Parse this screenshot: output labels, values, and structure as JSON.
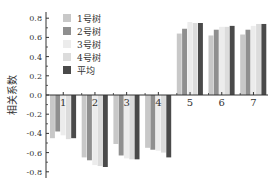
{
  "chart_data": {
    "type": "bar",
    "title": "",
    "xlabel": "",
    "ylabel": "相关系数",
    "categories": [
      "1",
      "2",
      "3",
      "4",
      "5",
      "6",
      "7"
    ],
    "ylim": [
      -0.8,
      0.8
    ],
    "yticks": [
      "0.8",
      "0.6",
      "0.4",
      "0.2",
      "0.0",
      "-0.2",
      "-0.4",
      "-0.6",
      "-0.8"
    ],
    "grid": false,
    "legend_position": "upper-left inside",
    "series": [
      {
        "name": "1号树",
        "color": "#c8c8c8",
        "values": [
          -0.45,
          -0.65,
          -0.51,
          -0.55,
          0.64,
          0.62,
          0.63
        ]
      },
      {
        "name": "2号树",
        "color": "#8f8f8f",
        "values": [
          -0.38,
          -0.68,
          -0.63,
          -0.57,
          0.69,
          0.68,
          0.68
        ]
      },
      {
        "name": "3号树",
        "color": "#ececec",
        "values": [
          -0.42,
          -0.73,
          -0.66,
          -0.58,
          0.76,
          0.71,
          0.72
        ]
      },
      {
        "name": "4号树",
        "color": "#dcdcdc",
        "values": [
          -0.46,
          -0.74,
          -0.67,
          -0.6,
          0.75,
          0.71,
          0.74
        ]
      },
      {
        "name": "平均",
        "color": "#4a4a4a",
        "values": [
          -0.45,
          -0.75,
          -0.67,
          -0.65,
          0.75,
          0.72,
          0.74
        ]
      }
    ]
  }
}
